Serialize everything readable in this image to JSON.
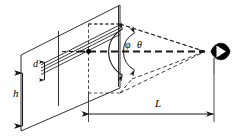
{
  "figure": {
    "type": "technical-line-diagram",
    "background_color": "#ffffff",
    "line_color": "#1a1a1a",
    "width": 247,
    "height": 139
  },
  "labels": {
    "h": "h",
    "d": "d",
    "L": "L",
    "phi": "φ",
    "theta": "θ"
  },
  "label_meanings": {
    "h": "screen height dimension",
    "d": "grating slit spacing dimension",
    "L": "viewing distance from grating plane to observer eye",
    "phi": "outer viewing half-angle",
    "theta": "inner viewing half-angle"
  },
  "elements": {
    "outer_plane": "large parallelogram screen in perspective",
    "inner_plane": "inner parallelogram grating panel",
    "grating_lines": "four parallel slit lines",
    "center_point": "filled dot at grating center",
    "axis": "dashed horizontal optical axis",
    "cone_lines": "dashed rays converging from grating edges to the eye",
    "eye": "observer eye symbol",
    "h_dimension": "double-headed vertical arrow for h",
    "d_dimension": "small double-headed vertical arrow for d",
    "L_dimension": "double-headed horizontal arrow for L",
    "phi_arc": "double-headed arc arrow marking angle phi",
    "theta_arc": "double-headed arc arrow marking angle theta"
  },
  "icons": {
    "eye": "eye-icon"
  },
  "colors": {
    "stroke": "#1a1a1a",
    "fill": "#000000",
    "background": "#ffffff"
  }
}
